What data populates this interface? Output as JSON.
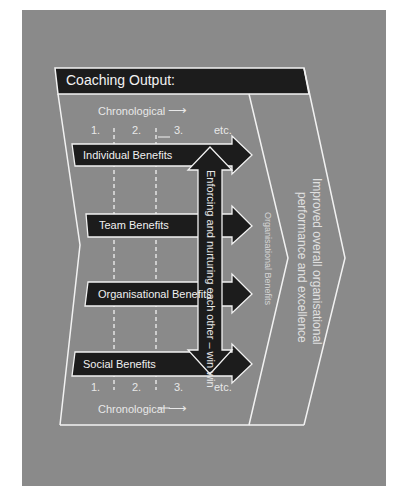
{
  "diagram": {
    "title": "Coaching Output:",
    "chronological_label": "Chronological",
    "chronological_arrow": "⟶",
    "steps_top": [
      "1.",
      "2.",
      "3.",
      "etc."
    ],
    "steps_bottom": [
      "1.",
      "2.",
      "3.",
      "etc."
    ],
    "benefits": [
      {
        "label": "Individual Benefits"
      },
      {
        "label": "Team Benefits"
      },
      {
        "label": "Organisational Benefits"
      },
      {
        "label": "Social Benefits"
      }
    ],
    "vertical_arrow_label": "Enforcing and nurturing each other – win win",
    "middle_chevron_label": "Organisational Benefits",
    "outer_chevron_label_line1": "Improved overall organisational",
    "outer_chevron_label_line2": "performance and excellence"
  },
  "colors": {
    "panel": "#8a8a8a",
    "bar": "#1c1c1c",
    "line": "#f2f2f2",
    "text": "#e8e8e8"
  }
}
